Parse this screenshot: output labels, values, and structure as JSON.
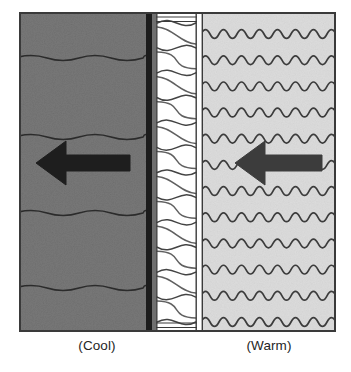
{
  "diagram": {
    "frame": {
      "x": 19,
      "y": 12,
      "width": 317,
      "height": 320,
      "border_color": "#3a3a3a",
      "border_width": 2
    },
    "layers": [
      {
        "id": "cool-side",
        "name": "cool-exterior-region",
        "label": "(Cool)",
        "x": 19,
        "width": 127,
        "fill": "#787878",
        "texture": "noise",
        "wave_type": "low-frequency",
        "wave_rows": 4,
        "wave_amplitude": 4,
        "wave_wavelength": 64,
        "wave_color": "#2b2b2b",
        "wave_y": [
          58,
          137,
          213,
          288
        ]
      },
      {
        "id": "vapor-barrier",
        "name": "vapor-barrier-strip",
        "label": "",
        "x": 146,
        "width": 6,
        "fill": "#1c1c1c",
        "texture": "solid"
      },
      {
        "id": "barrier-gap",
        "name": "barrier-gap-strip",
        "label": "",
        "x": 152,
        "width": 4,
        "fill": "#6f6f6f",
        "texture": "solid"
      },
      {
        "id": "insulation",
        "name": "batt-insulation-region",
        "label": "",
        "x": 156,
        "width": 41,
        "fill": "#ffffff",
        "texture": "batt-lobes",
        "lobe_count": 12,
        "lobe_color": "#444444",
        "edge_color": "#3a3a3a"
      },
      {
        "id": "sheathing-gap",
        "name": "interior-sheathing-gap",
        "label": "",
        "x": 197,
        "width": 6,
        "fill": "#ffffff",
        "texture": "solid"
      },
      {
        "id": "warm-side",
        "name": "warm-interior-region",
        "label": "(Warm)",
        "x": 203,
        "width": 133,
        "fill": "#dcdcdc",
        "texture": "noise",
        "wave_type": "high-frequency",
        "wave_rows": 12,
        "wave_amplitude": 7,
        "wave_wavelength": 18,
        "wave_color": "#3c3c3c",
        "wave_y": [
          35,
          72,
          105,
          140,
          173,
          203,
          237,
          268,
          298,
          325,
          355,
          385
        ]
      }
    ],
    "arrows": [
      {
        "id": "arrow-cool",
        "name": "heat-flow-arrow-cool-side",
        "direction": "left",
        "tip_x": 36,
        "tail_x": 130,
        "center_y": 163,
        "shaft_height": 16,
        "head_width": 30,
        "head_height": 44,
        "color": "#1e1e1e"
      },
      {
        "id": "arrow-warm",
        "name": "heat-flow-arrow-warm-side",
        "direction": "left",
        "tip_x": 235,
        "tail_x": 322,
        "center_y": 163,
        "shaft_height": 16,
        "head_width": 30,
        "head_height": 44,
        "color": "#3c3c3c"
      }
    ],
    "captions": {
      "cool": "(Cool)",
      "warm": "(Warm)"
    },
    "colors": {
      "background": "#ffffff",
      "cool_fill": "#787878",
      "warm_fill": "#dcdcdc",
      "insulation_fill": "#ffffff",
      "barrier": "#1c1c1c",
      "outline": "#3a3a3a",
      "caption_text": "#252525",
      "arrow_cool": "#1e1e1e",
      "arrow_warm": "#3c3c3c"
    }
  }
}
